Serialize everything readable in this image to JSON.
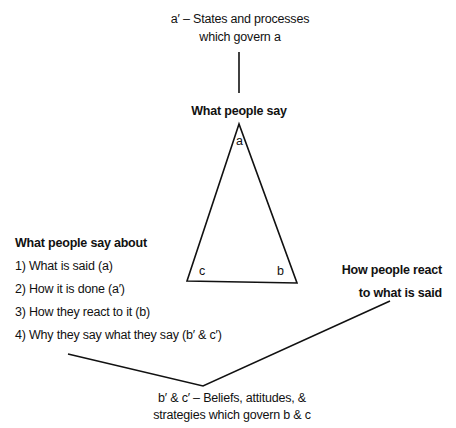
{
  "top_note": {
    "line1": "a′ – States and processes",
    "line2": "which govern a"
  },
  "triangle": {
    "title": "What people say",
    "vertex_a": "a",
    "vertex_b": "b",
    "vertex_c": "c"
  },
  "left_list": {
    "heading": "What people say about",
    "items": [
      "1) What is said (a)",
      "2) How it is done (a′)",
      "3) How they react to it (b)",
      "4) Why they say what they say (b′ & c′)"
    ]
  },
  "right_label": {
    "line1": "How people react",
    "line2": "to what is said"
  },
  "bottom_note": {
    "line1": "b′ & c′ – Beliefs, attitudes, &",
    "line2": "strategies which govern b & c"
  },
  "colors": {
    "stroke": "#111111",
    "background": "#ffffff"
  }
}
